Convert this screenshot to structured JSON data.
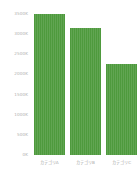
{
  "chart_data": {
    "type": "bar",
    "title": "",
    "subtitle": "",
    "xlabel": "",
    "ylabel": "",
    "categories": [
      "カテゴリA",
      "カテゴリB",
      "カテゴリC"
    ],
    "values": [
      3500,
      3150,
      2250
    ],
    "value_unit": "K",
    "ylim": [
      0,
      3500
    ],
    "yticks": [
      0,
      500,
      1000,
      1500,
      2000,
      2500,
      3000,
      3500
    ],
    "ytick_labels": [
      "0K",
      "500K",
      "1000K",
      "1500K",
      "2000K",
      "2500K",
      "3000K",
      "3500K"
    ],
    "grid": false,
    "legend": false,
    "legend_position": "none",
    "series": [
      {
        "name": "",
        "values": [
          3500,
          3150,
          2250
        ],
        "color": "#4e9a3d"
      }
    ]
  },
  "style": {
    "bar_color": "#4e9a3d",
    "background_color": "#ffffff",
    "tick_label_color": "#b0b0b0",
    "category_label_color": "#a8a8a8"
  }
}
